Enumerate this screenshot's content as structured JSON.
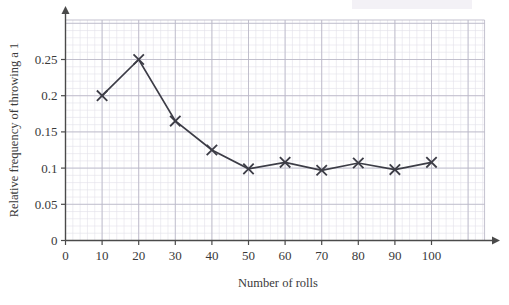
{
  "chart_data": {
    "type": "line",
    "title": "",
    "xlabel": "Number of rolls",
    "ylabel": "Relative frequency of throwing a 1",
    "x": [
      10,
      20,
      30,
      40,
      50,
      60,
      70,
      80,
      90,
      100
    ],
    "values": [
      0.2,
      0.25,
      0.165,
      0.125,
      0.099,
      0.108,
      0.097,
      0.107,
      0.098,
      0.108
    ],
    "series": [
      {
        "name": "Relative frequency of throwing a 1",
        "values": [
          0.2,
          0.25,
          0.165,
          0.125,
          0.099,
          0.108,
          0.097,
          0.107,
          0.098,
          0.108
        ]
      }
    ],
    "xlim": [
      0,
      115
    ],
    "ylim": [
      0,
      0.29
    ],
    "xticks": [
      0,
      10,
      20,
      30,
      40,
      50,
      60,
      70,
      80,
      90,
      100
    ],
    "yticks": [
      0,
      0.05,
      0.1,
      0.15,
      0.2,
      0.25
    ],
    "xtick_labels": [
      "0",
      "10",
      "20",
      "30",
      "40",
      "50",
      "60",
      "70",
      "80",
      "90",
      "100"
    ],
    "ytick_labels": [
      "0",
      "0.05",
      "0.1",
      "0.15",
      "0.2",
      "0.25"
    ],
    "grid": true,
    "minor_grid": true,
    "legend": "none",
    "marker": "x",
    "line_color": "#3c3c46",
    "grid_color": "#b9b7c6",
    "minor_grid_color": "#e2e0ea",
    "axis_color": "#4a4a4a"
  },
  "labels": {
    "x_axis_title": "Number of rolls",
    "y_axis_title": "Relative frequency of throwing a 1"
  }
}
